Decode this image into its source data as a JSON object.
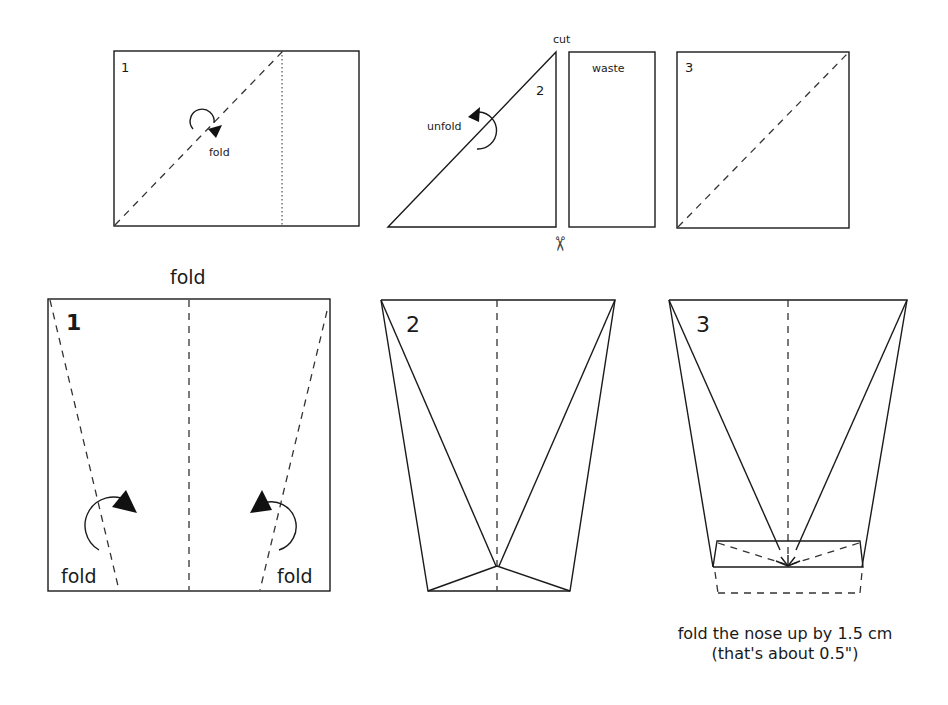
{
  "top_row": {
    "step1": {
      "number": "1",
      "fold_label": "fold"
    },
    "step2": {
      "number": "2",
      "unfold_label": "unfold",
      "cut_label": "cut",
      "waste_label": "waste",
      "scissors_icon": "✂"
    },
    "step3": {
      "number": "3"
    }
  },
  "bottom_row": {
    "step1": {
      "number": "1",
      "top_fold_label": "fold",
      "left_fold_label": "fold",
      "right_fold_label": "fold"
    },
    "step2": {
      "number": "2"
    },
    "step3": {
      "number": "3"
    }
  },
  "caption": {
    "line1": "fold the nose up  by 1.5 cm",
    "line2": "(that's about 0.5\")"
  }
}
